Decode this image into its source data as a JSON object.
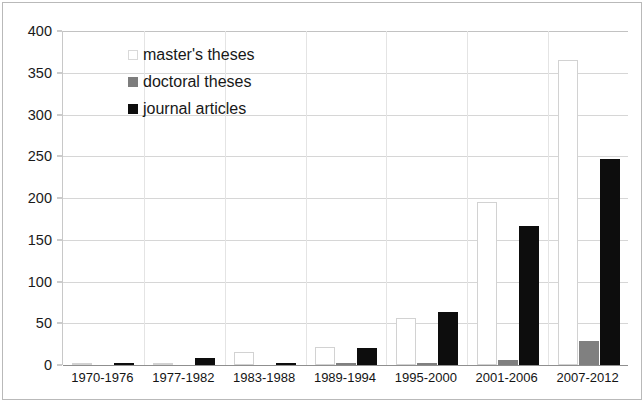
{
  "chart_data": {
    "type": "bar",
    "title": "",
    "subtitle": "",
    "xlabel": "",
    "ylabel": "",
    "grid": true,
    "legend_position": "inside-top-left",
    "ylim": [
      0,
      400
    ],
    "yticks": [
      0,
      50,
      100,
      150,
      200,
      250,
      300,
      350,
      400
    ],
    "ytick_labels": [
      "0",
      "50",
      "100",
      "150",
      "200",
      "250",
      "300",
      "350",
      "400"
    ],
    "categories": [
      "1970-1976",
      "1977-1982",
      "1983-1988",
      "1989-1994",
      "1995-2000",
      "2001-2006",
      "2007-2012"
    ],
    "series": [
      {
        "name": "master's theses",
        "color": "#ffffff",
        "values": [
          1,
          1,
          15,
          22,
          56,
          195,
          365
        ]
      },
      {
        "name": "doctoral theses",
        "color": "#808080",
        "values": [
          0,
          0,
          0,
          2,
          3,
          6,
          29
        ]
      },
      {
        "name": "journal articles",
        "color": "#0d0d0d",
        "values": [
          3,
          8,
          3,
          20,
          64,
          166,
          247
        ]
      }
    ]
  },
  "legend": {
    "items": [
      {
        "label": "master's theses",
        "swatch": "masters"
      },
      {
        "label": "doctoral theses",
        "swatch": "doctoral"
      },
      {
        "label": "journal articles",
        "swatch": "journal"
      }
    ]
  }
}
